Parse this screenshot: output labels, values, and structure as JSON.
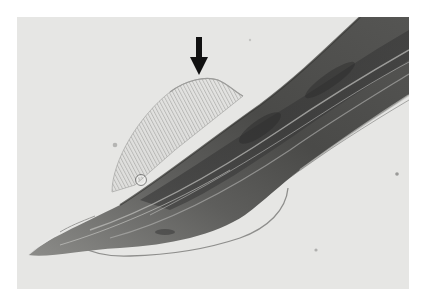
{
  "image": {
    "kind": "light micrograph",
    "colors": {
      "background": "#e6e6e4",
      "body_dark": "#3a3a3a",
      "body_mid": "#6e6e6c",
      "body_light": "#a9a9a6",
      "membrane_line": "#8a8a88",
      "arrow": "#111111"
    },
    "annotations": [
      {
        "type": "arrow",
        "direction": "down",
        "tip_x": 199,
        "tip_y": 75,
        "color": "#111111"
      }
    ]
  }
}
